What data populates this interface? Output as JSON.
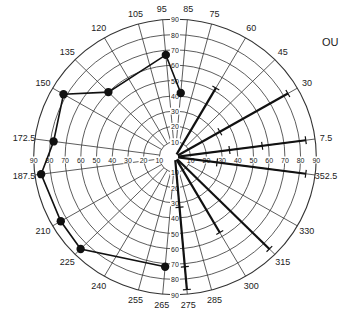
{
  "chart_data": {
    "type": "polar",
    "title": "OU",
    "angle_labels": [
      "7.5",
      "30",
      "45",
      "60",
      "75",
      "85",
      "95",
      "105",
      "120",
      "135",
      "150",
      "172.5",
      "187.5",
      "210",
      "225",
      "240",
      "255",
      "265",
      "275",
      "285",
      "300",
      "315",
      "330",
      "352.5"
    ],
    "radial_ticks": [
      10,
      20,
      30,
      40,
      50,
      60,
      70,
      80,
      90
    ],
    "rlim": [
      0,
      90
    ],
    "grid": true,
    "series": [
      {
        "name": "plotted-points",
        "style": "line-with-markers",
        "points": [
          {
            "angle": 85,
            "value": 42
          },
          {
            "angle": 95,
            "value": 67
          },
          {
            "angle": 135,
            "value": 60
          },
          {
            "angle": 150,
            "value": 82
          },
          {
            "angle": 172.5,
            "value": 78
          },
          {
            "angle": 187.5,
            "value": 86
          },
          {
            "angle": 210,
            "value": 84
          },
          {
            "angle": 225,
            "value": 85
          },
          {
            "angle": 265,
            "value": 72
          }
        ]
      },
      {
        "name": "radial-bars",
        "style": "bold-radial-with-ticks",
        "bars": [
          {
            "angle": 60,
            "length": 52,
            "ticks": [
              52
            ]
          },
          {
            "angle": 30,
            "length": 83,
            "ticks": [
              33,
              83
            ]
          },
          {
            "angle": 7.5,
            "length": 84,
            "ticks": [
              35,
              56,
              84
            ]
          },
          {
            "angle": 352.5,
            "length": 84,
            "ticks": [
              27,
              84
            ]
          },
          {
            "angle": 315,
            "length": 85,
            "ticks": [
              85
            ]
          },
          {
            "angle": 300,
            "length": 57,
            "ticks": [
              57
            ]
          },
          {
            "angle": 275,
            "length": 87,
            "ticks": [
              33,
              72,
              87
            ]
          }
        ]
      }
    ]
  }
}
